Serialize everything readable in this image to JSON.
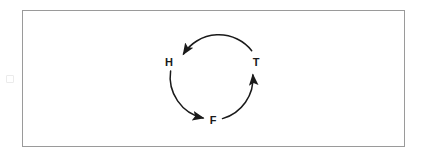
{
  "figure": {
    "title": "",
    "background_color": "#ffffff",
    "frame": {
      "border_color": "#9a9a9a",
      "border_width_px": 1,
      "x": 22,
      "y": 10,
      "width": 383,
      "height": 137
    },
    "ink_color": "#1a1a1a"
  },
  "diagram": {
    "type": "cycle",
    "direction": "clockwise",
    "center": {
      "x": 212,
      "y": 77
    },
    "radius": 42,
    "nodes": [
      {
        "id": "H",
        "label": "H",
        "label_x": 169,
        "label_y": 66,
        "angle_deg": 180
      },
      {
        "id": "F",
        "label": "F",
        "label_x": 213,
        "label_y": 124,
        "angle_deg": 90
      },
      {
        "id": "T",
        "label": "T",
        "label_x": 256,
        "label_y": 66,
        "angle_deg": 0
      }
    ],
    "edges": [
      {
        "from": "T",
        "to": "H",
        "arrowhead_at": "H"
      },
      {
        "from": "H",
        "to": "F",
        "arrowhead_at": "F"
      },
      {
        "from": "F",
        "to": "T",
        "arrowhead_at": "T"
      }
    ]
  },
  "artifacts": {
    "speck_left_margin": true
  }
}
